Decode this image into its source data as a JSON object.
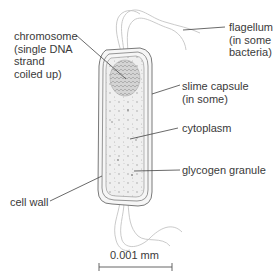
{
  "diagram": {
    "labels": {
      "chromosome": "chromosome\n(single DNA\nstrand\ncoiled up)",
      "flagellum": "flagellum\n(in some\nbacteria)",
      "slime_capsule": "slime capsule\n(in some)",
      "cytoplasm": "cytoplasm",
      "glycogen_granule": "glycogen granule",
      "cell_wall": "cell wall"
    },
    "scale_bar": {
      "label": "0.001 mm"
    },
    "colors": {
      "text": "#3a3a3a",
      "leader_line": "#444444",
      "outline": "#6e6e6e",
      "flagella": "#bdbdbd",
      "cytoplasm_fill": "#ececec",
      "chromosome_fill": "#c9c9c9"
    }
  }
}
